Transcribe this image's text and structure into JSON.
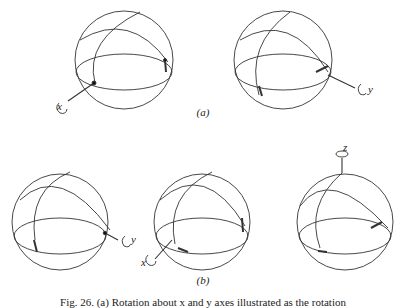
{
  "figure": {
    "panel_a_label": "(a)",
    "panel_b_label": "(b)",
    "caption": "Fig. 26. (a) Rotation about x and y axes illustrated as the rotation",
    "spheres": [
      {
        "id": "a1",
        "axis_label": "x"
      },
      {
        "id": "a2",
        "axis_label": "y"
      },
      {
        "id": "b1",
        "axis_label": "y"
      },
      {
        "id": "b2",
        "axis_label": "x"
      },
      {
        "id": "b3",
        "axis_label": "z"
      }
    ]
  }
}
